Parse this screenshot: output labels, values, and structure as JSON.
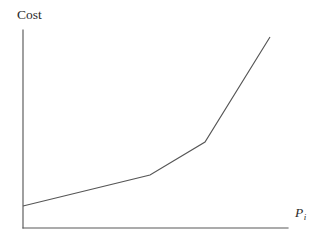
{
  "figure": {
    "background_color": "#ffffff",
    "line_color": "#565656",
    "axis_color": "#595959"
  },
  "labels": {
    "y_axis": "Cost",
    "x_axis_symbol": "P",
    "x_axis_subscript": "i"
  },
  "chart_data": {
    "type": "line",
    "title": "",
    "xlabel": "P_i",
    "ylabel": "Cost",
    "grid": false,
    "legend": null,
    "axis_ticks": {
      "x": [],
      "y": []
    },
    "axis_style": "open-L (left spine and bottom spine only, no arrowheads, no tick marks)",
    "series": [
      {
        "name": "Cost curve",
        "points_px": [
          [
            23,
            206
          ],
          [
            150,
            175
          ],
          [
            205,
            142
          ],
          [
            270,
            37
          ]
        ],
        "x": [
          0.0,
          0.479,
          0.687,
          0.932
        ],
        "y": [
          0.111,
          0.268,
          0.434,
          0.964
        ],
        "segment_slopes": [
          "shallow",
          "moderate",
          "steep"
        ]
      }
    ],
    "axes_px": {
      "origin": [
        23,
        228
      ],
      "y_axis_top": [
        23,
        30
      ],
      "x_axis_right": [
        288,
        228
      ]
    },
    "xlim": [
      0,
      1
    ],
    "ylim": [
      0,
      1
    ]
  }
}
